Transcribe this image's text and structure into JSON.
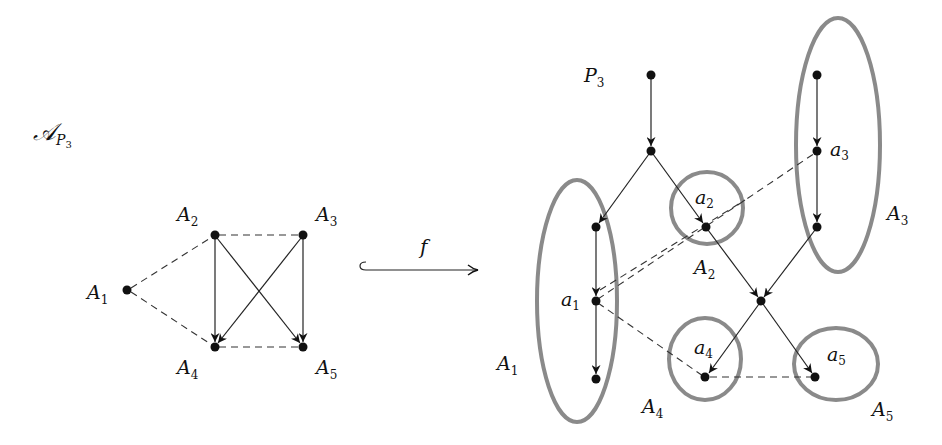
{
  "left_graph": {
    "title": "𝒜",
    "title_sub": "P",
    "title_subsub": "3",
    "nodes": [
      {
        "id": "A1",
        "label": "A",
        "sub": "1"
      },
      {
        "id": "A2",
        "label": "A",
        "sub": "2"
      },
      {
        "id": "A3",
        "label": "A",
        "sub": "3"
      },
      {
        "id": "A4",
        "label": "A",
        "sub": "4"
      },
      {
        "id": "A5",
        "label": "A",
        "sub": "5"
      }
    ],
    "directed_edges": [
      [
        "A2",
        "A4"
      ],
      [
        "A2",
        "A5"
      ],
      [
        "A3",
        "A4"
      ],
      [
        "A3",
        "A5"
      ]
    ],
    "dashed_edges": [
      [
        "A1",
        "A2"
      ],
      [
        "A1",
        "A4"
      ],
      [
        "A2",
        "A3"
      ],
      [
        "A4",
        "A5"
      ]
    ]
  },
  "map": {
    "label": "f",
    "type": "hooked-arrow"
  },
  "right_graph": {
    "poset_label": "P",
    "poset_sub": "3",
    "element_labels": [
      {
        "id": "a1",
        "label": "a",
        "sub": "1"
      },
      {
        "id": "a2",
        "label": "a",
        "sub": "2"
      },
      {
        "id": "a3",
        "label": "a",
        "sub": "3"
      },
      {
        "id": "a4",
        "label": "a",
        "sub": "4"
      },
      {
        "id": "a5",
        "label": "a",
        "sub": "5"
      }
    ],
    "region_labels": [
      {
        "id": "A1",
        "label": "A",
        "sub": "1"
      },
      {
        "id": "A2",
        "label": "A",
        "sub": "2"
      },
      {
        "id": "A3",
        "label": "A",
        "sub": "3"
      },
      {
        "id": "A4",
        "label": "A",
        "sub": "4"
      },
      {
        "id": "A5",
        "label": "A",
        "sub": "5"
      }
    ]
  },
  "colors": {
    "node": "#111111",
    "edge": "#222222",
    "region_outline": "#8a8a8a",
    "background": "#ffffff"
  }
}
